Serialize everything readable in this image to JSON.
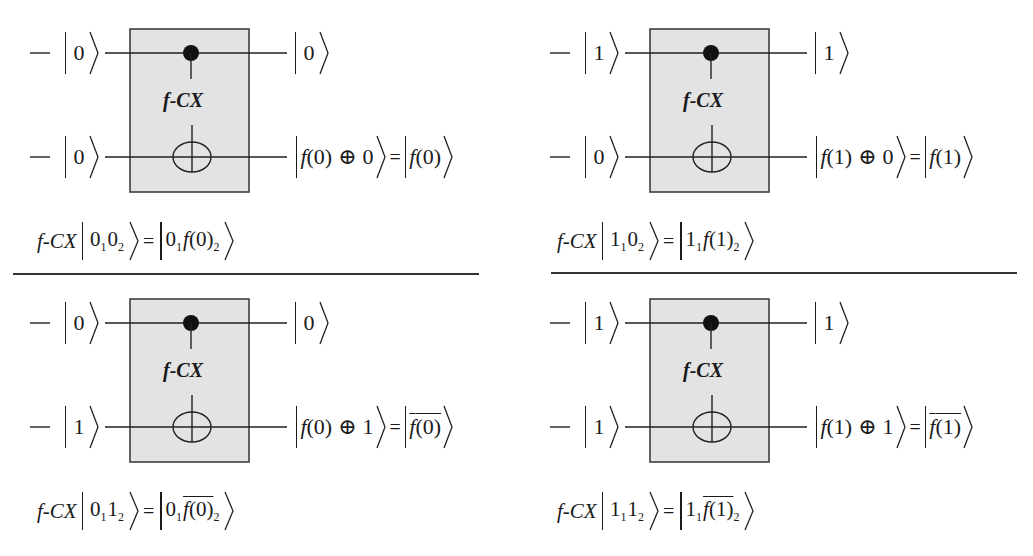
{
  "gate": {
    "label": "f-CX",
    "box_fill": "#e3e3e3",
    "box_stroke": "#333333"
  },
  "panels": [
    {
      "input_top": "0",
      "input_bottom": "0",
      "output_top": "0",
      "output_bottom_lhs_fn": "f",
      "output_bottom_lhs_arg": "(0)",
      "output_bottom_lhs_xor": "0",
      "output_bottom_rhs": "f(0)",
      "output_bottom_rhs_negated": false,
      "equation": {
        "operator": "f-CX",
        "in_q1": "0",
        "in_q1_sub": "1",
        "in_q2": "0",
        "in_q2_sub": "2",
        "eq": "=",
        "out_q1": "0",
        "out_q1_sub": "1",
        "out_q2": "f(0)",
        "out_q2_sub": "2",
        "out_q2_negated": false
      }
    },
    {
      "input_top": "1",
      "input_bottom": "0",
      "output_top": "1",
      "output_bottom_lhs_fn": "f",
      "output_bottom_lhs_arg": "(1)",
      "output_bottom_lhs_xor": "0",
      "output_bottom_rhs": "f(1)",
      "output_bottom_rhs_negated": false,
      "equation": {
        "operator": "f-CX",
        "in_q1": "1",
        "in_q1_sub": "1",
        "in_q2": "0",
        "in_q2_sub": "2",
        "eq": "=",
        "out_q1": "1",
        "out_q1_sub": "1",
        "out_q2": "f(1)",
        "out_q2_sub": "2",
        "out_q2_negated": false
      }
    },
    {
      "input_top": "0",
      "input_bottom": "1",
      "output_top": "0",
      "output_bottom_lhs_fn": "f",
      "output_bottom_lhs_arg": "(0)",
      "output_bottom_lhs_xor": "1",
      "output_bottom_rhs": "f(0)",
      "output_bottom_rhs_negated": true,
      "equation": {
        "operator": "f-CX",
        "in_q1": "0",
        "in_q1_sub": "1",
        "in_q2": "1",
        "in_q2_sub": "2",
        "eq": "=",
        "out_q1": "0",
        "out_q1_sub": "1",
        "out_q2": "f(0)",
        "out_q2_sub": "2",
        "out_q2_negated": true
      }
    },
    {
      "input_top": "1",
      "input_bottom": "1",
      "output_top": "1",
      "output_bottom_lhs_fn": "f",
      "output_bottom_lhs_arg": "(1)",
      "output_bottom_lhs_xor": "1",
      "output_bottom_rhs": "f(1)",
      "output_bottom_rhs_negated": true,
      "equation": {
        "operator": "f-CX",
        "in_q1": "1",
        "in_q1_sub": "1",
        "in_q2": "1",
        "in_q2_sub": "2",
        "eq": "=",
        "out_q1": "1",
        "out_q1_sub": "1",
        "out_q2": "f(1)",
        "out_q2_sub": "2",
        "out_q2_negated": true
      }
    }
  ],
  "symbols": {
    "oplus": "⊕",
    "equals": "="
  }
}
